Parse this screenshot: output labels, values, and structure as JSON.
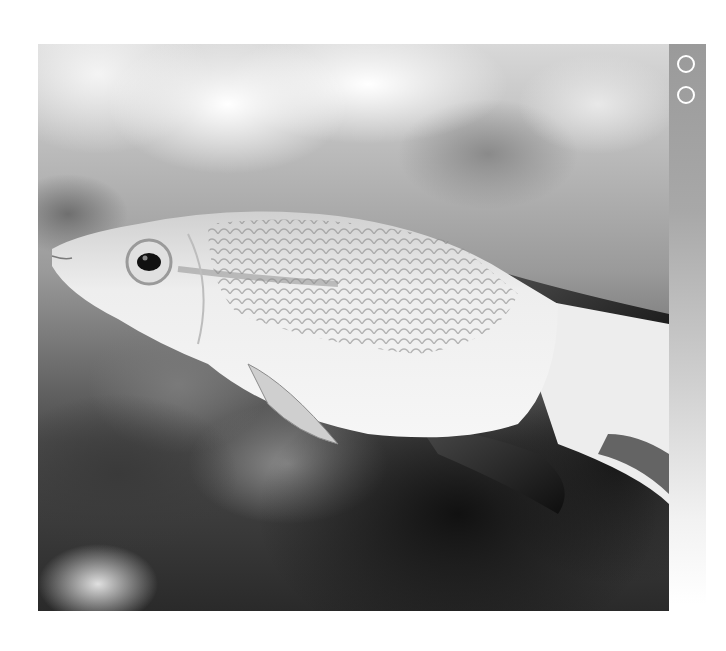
{
  "page": {
    "background": "#ffffff"
  },
  "photo": {
    "subject": "fish-photograph",
    "style": "grayscale",
    "colors": {
      "fish_body": "#e6e6e6",
      "fins_dark": "#1a1a1a",
      "background_dark": "#222222",
      "background_light": "#f4f4f4"
    }
  },
  "side_strip": {
    "color_top": "#9a9a9a",
    "color_bottom": "#ffffff",
    "markers": [
      {
        "icon": "circle-outline-icon"
      },
      {
        "icon": "circle-outline-icon"
      }
    ]
  }
}
